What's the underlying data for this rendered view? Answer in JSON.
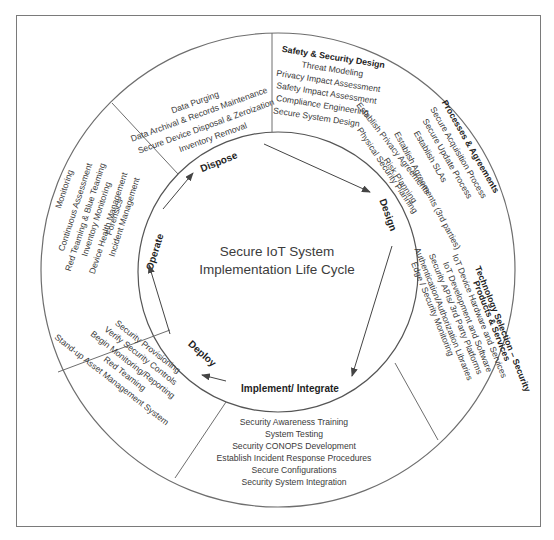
{
  "title": {
    "line1": "Secure IoT System",
    "line2": "Implementation Life Cycle"
  },
  "phases": {
    "dispose": "Dispose",
    "design": "Design",
    "implement": "Implement/ Integrate",
    "deploy": "Deploy",
    "operate": "Operate"
  },
  "segments": {
    "dispose": {
      "items": [
        "Data Purging",
        "Data Archival & Records Maintenance",
        "Secure Device Disposal & Zeroization",
        "Inventory Removal"
      ]
    },
    "safety_design": {
      "heading": "Safety & Security Design",
      "items": [
        "Threat Modeling",
        "Privacy Impact Assessment",
        "Safety Impact Assessment",
        "Compliance Engineering",
        "Secure System Design"
      ]
    },
    "design_inner": {
      "items": [
        "Establish Privacy Agreements",
        "Risk Planning",
        "Physical Security Planning"
      ]
    },
    "processes": {
      "heading": "Processes & Agreements",
      "items": [
        "Secure Acquisition Process",
        "Secure Update Process",
        "Establish SLAs",
        "Establish Agreements (3rd parties)"
      ]
    },
    "technology": {
      "heading": "Technology Selection – Security",
      "subheading": "Products & Services",
      "items": [
        "IoT Device Hardware and Services",
        "IoT Development and Software",
        "Security APIs/ 3rd Party Platforms",
        "Authentication/Authorization Libraries",
        "Edge / Security Monitoring"
      ]
    },
    "implement": {
      "items": [
        "Security Awareness Training",
        "System Testing",
        "Security CONOPS Development",
        "Establish Incident Response Procedures",
        "Secure Configurations",
        "Security System Integration"
      ]
    },
    "deploy": {
      "items": [
        "Security Provisioning",
        "Verify Security Controls",
        "Begin Monitoring/Reporting",
        "Red Teaming",
        "Stand-up Asset Management System"
      ]
    },
    "operate": {
      "items": [
        "Monitoring",
        "Continuous Assessment",
        "Red Teaming & Blue Teaming",
        "Inventory Monitoring",
        "Device Health Management",
        "Forensics",
        "Incident Management"
      ]
    }
  },
  "colors": {
    "line": "#6e6e6e",
    "text": "#3a3a3a",
    "fill": "#ffffff"
  }
}
